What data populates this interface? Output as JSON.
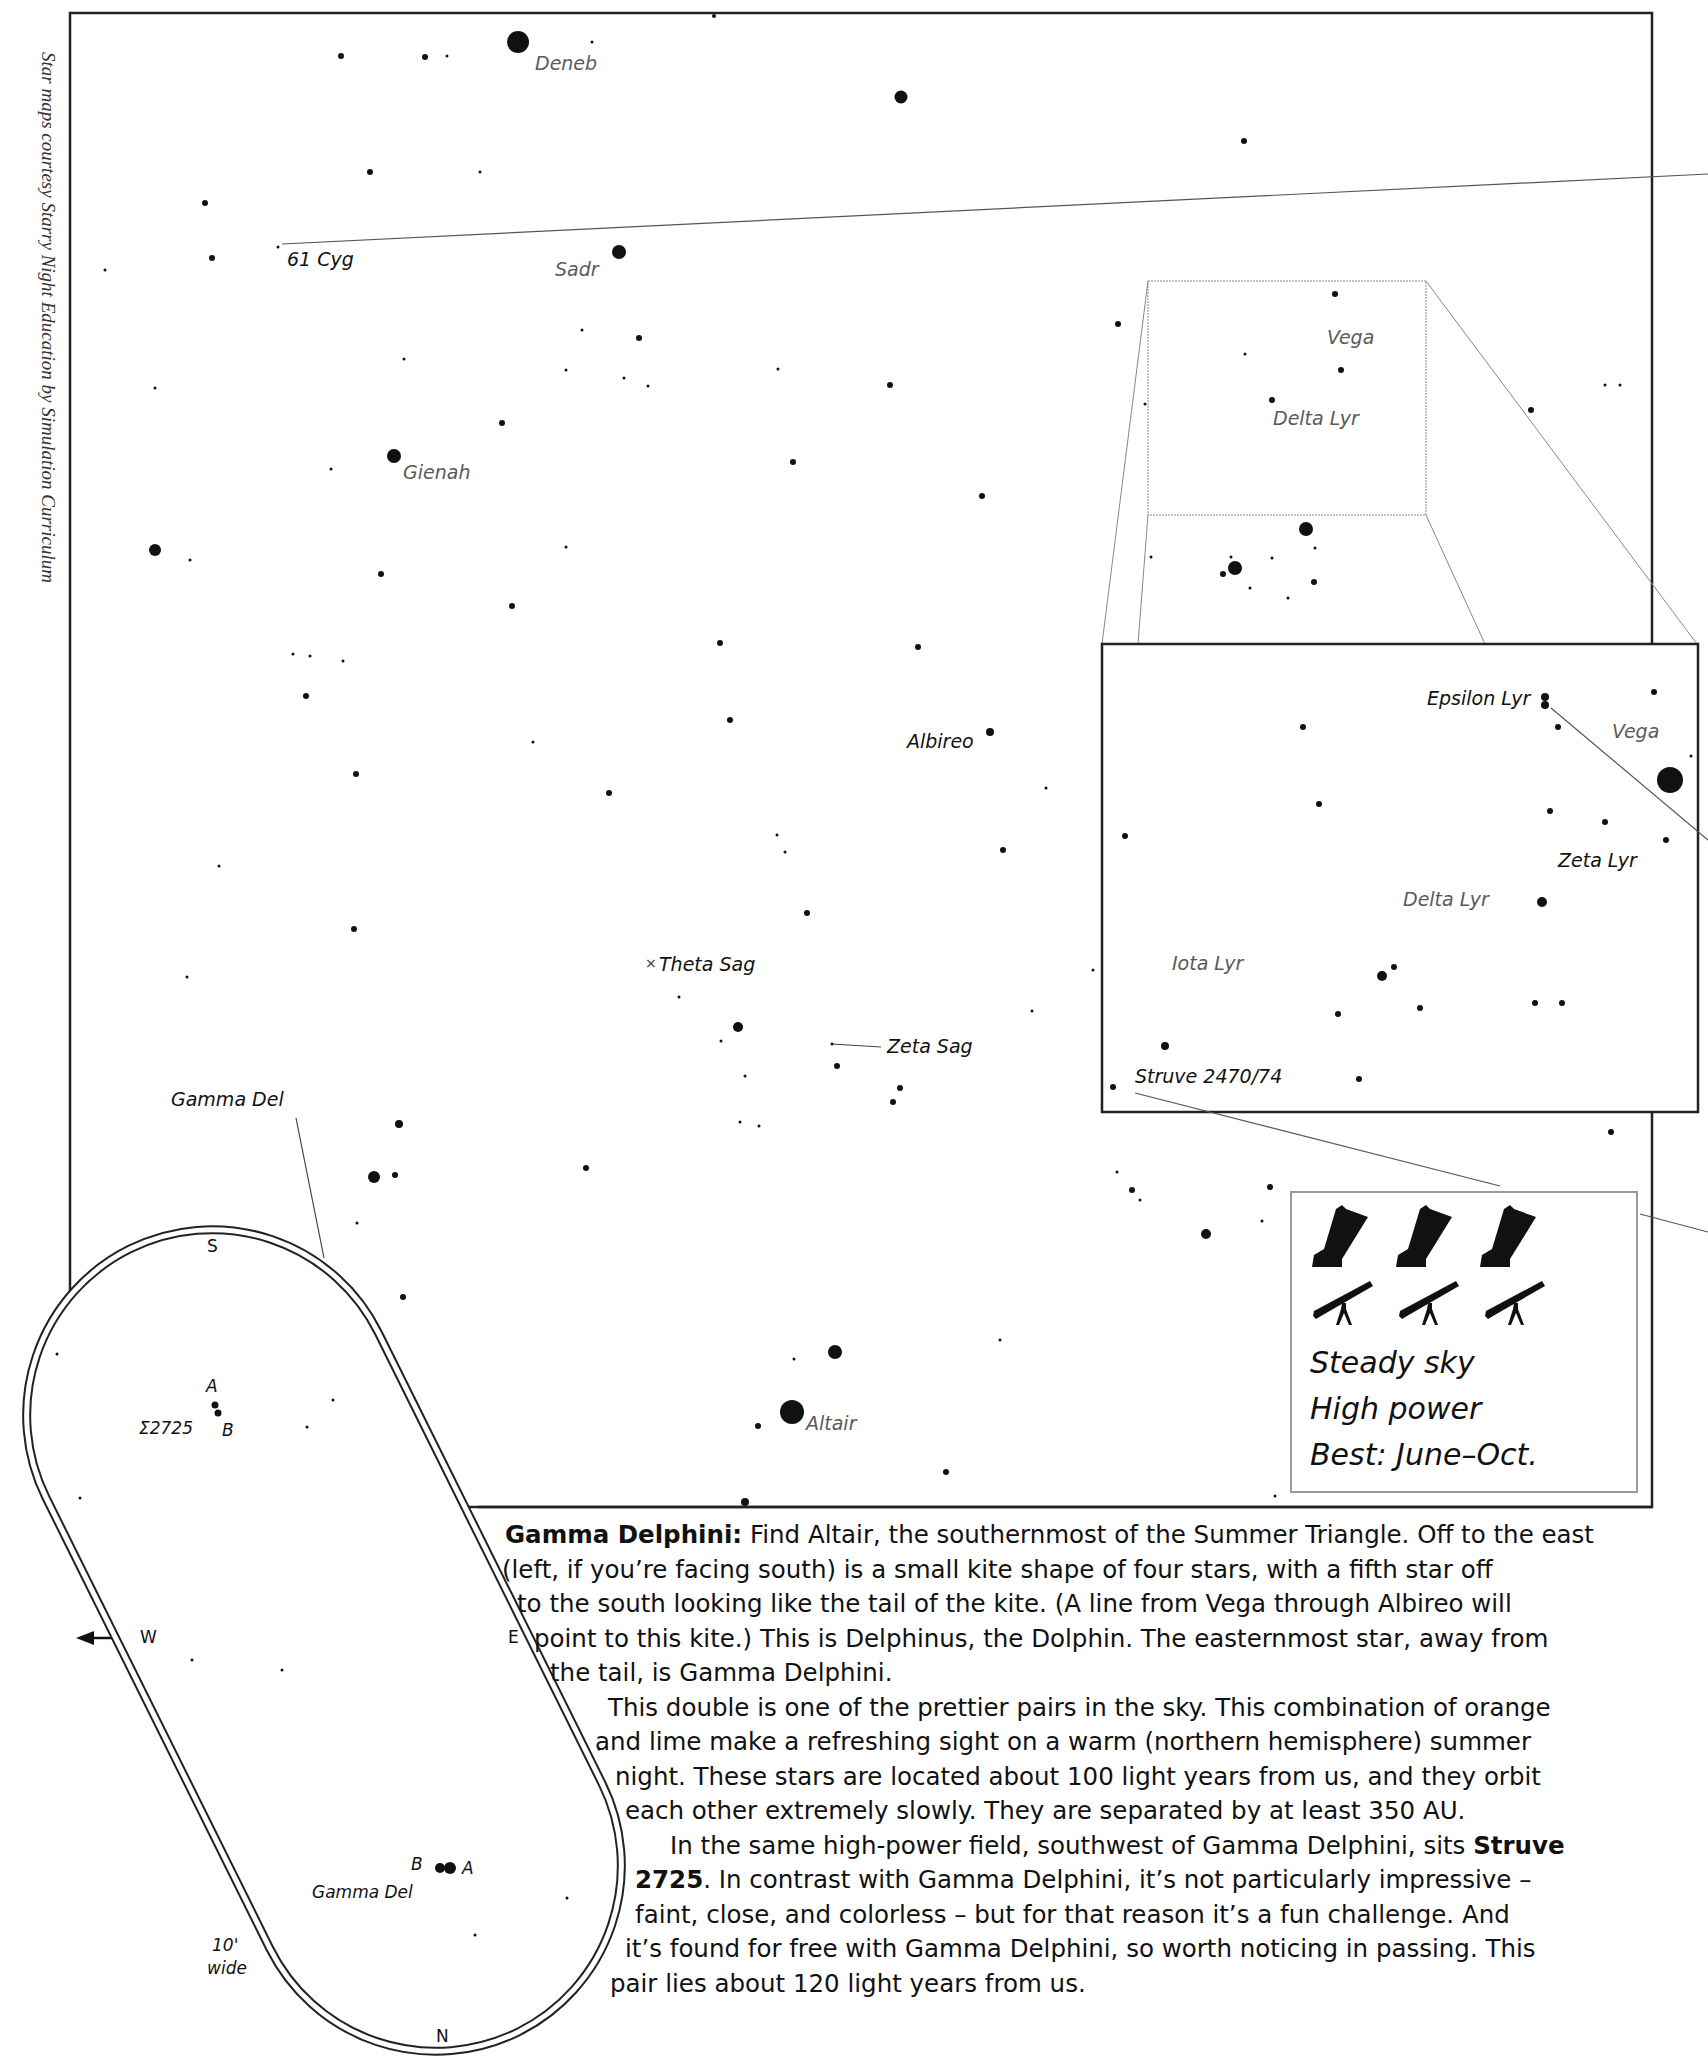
{
  "credit": "Star maps courtesy Starry Night Education by Simulation Curriculum",
  "main_map": {
    "frame": {
      "x": 70,
      "y": 13,
      "w": 1582,
      "h": 1494
    },
    "labels": [
      {
        "text": "Deneb",
        "x": 535,
        "y": 54,
        "tone": "gray"
      },
      {
        "text": "61 Cyg",
        "x": 287,
        "y": 250,
        "tone": "dark"
      },
      {
        "text": "Sadr",
        "x": 555,
        "y": 260,
        "tone": "gray"
      },
      {
        "text": "Gienah",
        "x": 403,
        "y": 463,
        "tone": "gray"
      },
      {
        "text": "Vega",
        "x": 1327,
        "y": 328,
        "tone": "gray"
      },
      {
        "text": "Delta Lyr",
        "x": 1273,
        "y": 409,
        "tone": "gray"
      },
      {
        "text": "Albireo",
        "x": 907,
        "y": 732,
        "tone": "dark"
      },
      {
        "text": "Theta Sag",
        "x": 659,
        "y": 955,
        "tone": "dark"
      },
      {
        "text": "Zeta Sag",
        "x": 887,
        "y": 1037,
        "tone": "dark"
      },
      {
        "text": "Gamma Del",
        "x": 171,
        "y": 1090,
        "tone": "dark"
      },
      {
        "text": "Altair",
        "x": 806,
        "y": 1414,
        "tone": "gray"
      }
    ],
    "theta_sag_marker": "×"
  },
  "inset": {
    "frame": {
      "x": 1102,
      "y": 644,
      "w": 596,
      "h": 468
    },
    "labels": [
      {
        "text": "Epsilon Lyr",
        "x": 1427,
        "y": 689,
        "tone": "dark"
      },
      {
        "text": "Vega",
        "x": 1612,
        "y": 722,
        "tone": "gray"
      },
      {
        "text": "Zeta Lyr",
        "x": 1558,
        "y": 851,
        "tone": "dark"
      },
      {
        "text": "Delta Lyr",
        "x": 1403,
        "y": 890,
        "tone": "gray"
      },
      {
        "text": "Iota Lyr",
        "x": 1172,
        "y": 954,
        "tone": "gray"
      },
      {
        "text": "Struve 2470/74",
        "x": 1135,
        "y": 1067,
        "tone": "dark"
      }
    ]
  },
  "conditions_box": {
    "dobsonian_count": 3,
    "refractor_count": 3,
    "lines": [
      "Steady sky",
      "High power",
      "Best: June–Oct."
    ]
  },
  "eyepiece_view": {
    "compass": {
      "S": "S",
      "N": "N",
      "W": "W",
      "E": "E"
    },
    "width_label": [
      "10'",
      "wide"
    ],
    "labels": [
      {
        "text": "A",
        "x": 206,
        "y": 1378
      },
      {
        "text": "Σ2725",
        "x": 139,
        "y": 1420
      },
      {
        "text": "B",
        "x": 222,
        "y": 1422
      },
      {
        "text": "B",
        "x": 411,
        "y": 1856
      },
      {
        "text": "A",
        "x": 462,
        "y": 1860
      },
      {
        "text": "Gamma Del",
        "x": 312,
        "y": 1884
      }
    ]
  },
  "description": {
    "title": "Gamma Delphini:",
    "lines": [
      {
        "x": 35,
        "text": " Find Altair, the southernmost of the Summer Triangle. Off to the east",
        "lead_bold": "Gamma Delphini:"
      },
      {
        "x": 32,
        "text": "(left, if you’re facing south) is a small kite shape of four stars, with a fifth star off"
      },
      {
        "x": 47,
        "text": "to the south looking like the tail of the kite. (A line from Vega through Albireo will"
      },
      {
        "x": 64,
        "text": "point to this kite.) This is Delphinus, the Dolphin. The easternmost star, away from"
      },
      {
        "x": 80,
        "text": "the tail, is Gamma Delphini."
      },
      {
        "x": 138,
        "text": "This double is one of the prettier pairs in the sky. This combination of orange"
      },
      {
        "x": 125,
        "text": "and lime make a refreshing sight on a warm (northern hemisphere) summer"
      },
      {
        "x": 145,
        "text": "night. These stars are located about 100 light years from us, and they orbit"
      },
      {
        "x": 155,
        "text": "each other extremely slowly. They are separated by at least 350 AU."
      },
      {
        "x": 200,
        "text": "In the same high-power field, southwest of Gamma Delphini, sits ",
        "tail_bold": "Struve"
      },
      {
        "x": 165,
        "text": ". In contrast with Gamma Delphini, it’s not particularly impressive –",
        "lead_bold": "2725"
      },
      {
        "x": 165,
        "text": "faint, close, and colorless – but for that reason it’s a fun challenge. And"
      },
      {
        "x": 155,
        "text": "it’s found for free with Gamma Delphini, so worth noticing in passing. This"
      },
      {
        "x": 140,
        "text": "pair lies about 120 light years from us."
      }
    ]
  },
  "stars_main": [
    [
      518,
      42,
      11
    ],
    [
      714,
      16,
      2
    ],
    [
      341,
      56,
      3
    ],
    [
      425,
      57,
      3
    ],
    [
      447,
      56,
      1.5
    ],
    [
      592,
      42,
      1.5
    ],
    [
      901,
      97,
      6.5
    ],
    [
      1244,
      141,
      3
    ],
    [
      370,
      172,
      3
    ],
    [
      480,
      172,
      1.5
    ],
    [
      205,
      203,
      3
    ],
    [
      212,
      258,
      3
    ],
    [
      619,
      252,
      7
    ],
    [
      278,
      247,
      1.5
    ],
    [
      105,
      270,
      1.5
    ],
    [
      582,
      330,
      1.5
    ],
    [
      639,
      338,
      3
    ],
    [
      566,
      370,
      1.5
    ],
    [
      624,
      378,
      1.5
    ],
    [
      648,
      386,
      1.5
    ],
    [
      778,
      369,
      1.5
    ],
    [
      890,
      385,
      3
    ],
    [
      1118,
      324,
      3
    ],
    [
      1335,
      294,
      3
    ],
    [
      1245,
      354,
      1.5
    ],
    [
      1341,
      370,
      3
    ],
    [
      1314,
      582,
      3
    ],
    [
      1272,
      400,
      3
    ],
    [
      1145,
      404,
      1.5
    ],
    [
      1531,
      410,
      3
    ],
    [
      1605,
      385,
      1.5
    ],
    [
      1620,
      385,
      1.5
    ],
    [
      404,
      359,
      1.5
    ],
    [
      394,
      456,
      7
    ],
    [
      155,
      388,
      1.5
    ],
    [
      502,
      423,
      3
    ],
    [
      793,
      462,
      3
    ],
    [
      982,
      496,
      3
    ],
    [
      331,
      469,
      1.5
    ],
    [
      155,
      550,
      6
    ],
    [
      190,
      560,
      1.5
    ],
    [
      381,
      574,
      3
    ],
    [
      512,
      606,
      3
    ],
    [
      566,
      547,
      1.5
    ],
    [
      1235,
      568,
      7
    ],
    [
      1223,
      574,
      3
    ],
    [
      1306,
      529,
      7
    ],
    [
      1231,
      557,
      1.5
    ],
    [
      1151,
      557,
      1.5
    ],
    [
      1315,
      548,
      1.5
    ],
    [
      1272,
      558,
      1.5
    ],
    [
      1250,
      588,
      1.5
    ],
    [
      1288,
      598,
      1.5
    ],
    [
      720,
      643,
      3
    ],
    [
      918,
      647,
      3
    ],
    [
      310,
      656,
      1.5
    ],
    [
      293,
      654,
      1.5
    ],
    [
      343,
      661,
      1.5
    ],
    [
      306,
      696,
      3
    ],
    [
      730,
      720,
      3
    ],
    [
      990,
      732,
      4
    ],
    [
      356,
      774,
      3
    ],
    [
      609,
      793,
      3
    ],
    [
      533,
      742,
      1.5
    ],
    [
      1046,
      788,
      1.5
    ],
    [
      219,
      866,
      1.5
    ],
    [
      785,
      852,
      1.5
    ],
    [
      1003,
      850,
      3
    ],
    [
      777,
      835,
      1.5
    ],
    [
      807,
      913,
      3
    ],
    [
      354,
      929,
      3
    ],
    [
      187,
      977,
      1.5
    ],
    [
      679,
      997,
      1.5
    ],
    [
      738,
      1027,
      5
    ],
    [
      832,
      1044,
      1.5
    ],
    [
      837,
      1066,
      3
    ],
    [
      900,
      1088,
      3
    ],
    [
      893,
      1102,
      3
    ],
    [
      1032,
      1011,
      1.5
    ],
    [
      721,
      1041,
      1.5
    ],
    [
      745,
      1076,
      1.5
    ],
    [
      740,
      1122,
      1.5
    ],
    [
      759,
      1126,
      1.5
    ],
    [
      586,
      1168,
      3
    ],
    [
      399,
      1124,
      4
    ],
    [
      374,
      1177,
      6
    ],
    [
      395,
      1175,
      3
    ],
    [
      357,
      1223,
      1.5
    ],
    [
      403,
      1297,
      3
    ],
    [
      393,
      1360,
      3
    ],
    [
      332,
      1400,
      1.5
    ],
    [
      307,
      1427,
      1.5
    ],
    [
      745,
      1502,
      4
    ],
    [
      758,
      1426,
      3
    ],
    [
      835,
      1352,
      7
    ],
    [
      792,
      1412,
      12
    ],
    [
      794,
      1359,
      1.5
    ],
    [
      946,
      1472,
      3
    ],
    [
      1000,
      1340,
      1.5
    ],
    [
      1206,
      1234,
      5
    ],
    [
      1270,
      1187,
      3
    ],
    [
      1262,
      1221,
      1.5
    ],
    [
      1140,
      1200,
      1.5
    ],
    [
      1117,
      1172,
      1.5
    ],
    [
      1625,
      1452,
      1.5
    ],
    [
      1275,
      1496,
      1.5
    ],
    [
      1650,
      1000,
      1.5
    ],
    [
      1490,
      1060,
      1.5
    ],
    [
      1600,
      1000,
      1.5
    ]
  ],
  "stars_inset": [
    [
      1545,
      697,
      4
    ],
    [
      1545,
      705,
      4
    ],
    [
      1654,
      692,
      3
    ],
    [
      1558,
      727,
      3
    ],
    [
      1670,
      780,
      13
    ],
    [
      1691,
      756,
      1.5
    ],
    [
      1303,
      727,
      3
    ],
    [
      1319,
      804,
      3
    ],
    [
      1125,
      836,
      3
    ],
    [
      1550,
      811,
      3
    ],
    [
      1605,
      822,
      3
    ],
    [
      1666,
      840,
      3
    ],
    [
      1542,
      902,
      5
    ],
    [
      1382,
      976,
      5
    ],
    [
      1394,
      967,
      3
    ],
    [
      1420,
      1008,
      3
    ],
    [
      1338,
      1014,
      3
    ],
    [
      1535,
      1003,
      3
    ],
    [
      1562,
      1003,
      3
    ],
    [
      1165,
      1046,
      4
    ],
    [
      1113,
      1087,
      3
    ],
    [
      1359,
      1079,
      3
    ],
    [
      1611,
      1132,
      3
    ],
    [
      1132,
      1190,
      3
    ],
    [
      1093,
      970,
      1.5
    ]
  ],
  "stars_eyepiece": [
    [
      215,
      1405,
      3.5
    ],
    [
      218,
      1413,
      3.5
    ],
    [
      57,
      1354,
      1.5
    ],
    [
      333,
      1400,
      1.5
    ],
    [
      307,
      1427,
      1.5
    ],
    [
      80,
      1498,
      1.5
    ],
    [
      192,
      1660,
      1.5
    ],
    [
      282,
      1670,
      1.5
    ],
    [
      440,
      1868,
      5
    ],
    [
      450,
      1868,
      6
    ],
    [
      599,
      1749,
      1.5
    ],
    [
      567,
      1898,
      1.5
    ],
    [
      475,
      1935,
      1.5
    ]
  ]
}
